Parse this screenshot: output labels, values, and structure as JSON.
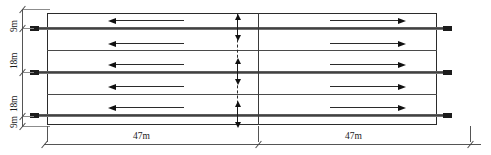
{
  "drawing": {
    "title": "roadway-cross-section-dimension-diagram",
    "units": "m",
    "vertical_dimensions": [
      {
        "label": "9m",
        "value": 9
      },
      {
        "label": "18m",
        "value": 18
      },
      {
        "label": "18m",
        "value": 18
      },
      {
        "label": "9m",
        "value": 9
      }
    ],
    "horizontal_dimensions": [
      {
        "label": "47m",
        "value": 47
      },
      {
        "label": "47m",
        "value": 47
      }
    ],
    "flow_arrows": {
      "left_half_direction": "left",
      "right_half_direction": "right",
      "left_count": 3,
      "right_count": 3
    },
    "center_marker": {
      "style": "dashed",
      "arrow_style": "double-headed"
    },
    "colors": {
      "line": "#2b2b2b",
      "band": "#3a3a3a",
      "dimension": "#555555",
      "background": "#ffffff"
    }
  }
}
